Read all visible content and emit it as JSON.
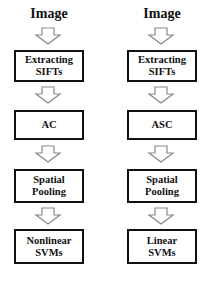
{
  "diagram": {
    "columns": [
      {
        "title": "Image",
        "steps": [
          {
            "line1": "Extracting",
            "line2": "SIFTs"
          },
          {
            "line1": "AC",
            "line2": ""
          },
          {
            "line1": "Spatial",
            "line2": "Pooling"
          },
          {
            "line1": "Nonlinear",
            "line2": "SVMs"
          }
        ]
      },
      {
        "title": "Image",
        "steps": [
          {
            "line1": "Extracting",
            "line2": "SIFTs"
          },
          {
            "line1": "ASC",
            "line2": ""
          },
          {
            "line1": "Spatial",
            "line2": "Pooling"
          },
          {
            "line1": "Linear",
            "line2": "SVMs"
          }
        ]
      }
    ],
    "arrow_icon": "hollow-down-arrow",
    "colors": {
      "stroke": "#111111",
      "arrow_stroke": "#888888",
      "background": "#ffffff"
    }
  }
}
